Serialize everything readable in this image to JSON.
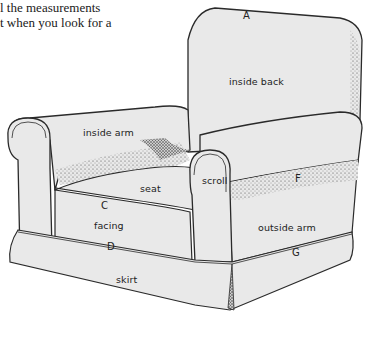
{
  "caption": {
    "line1": "l the measurements",
    "line2": "t when you look for a"
  },
  "labels": {
    "A": "A",
    "inside_back": "inside back",
    "inside_arm": "inside arm",
    "seat": "seat",
    "scroll": "scroll",
    "F": "F",
    "C": "C",
    "facing": "facing",
    "outside_arm": "outside arm",
    "D": "D",
    "G": "G",
    "skirt": "skirt"
  },
  "colors": {
    "fabric": "#e9e9e9",
    "outline": "#2a2a2a",
    "shade": "#555555",
    "background": "#ffffff"
  }
}
